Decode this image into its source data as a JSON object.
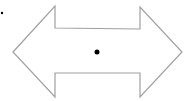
{
  "diagram": {
    "shape": "left-right-double-arrow",
    "stroke_color": "#a0a0a0",
    "fill_color": "#ffffff",
    "dot_color": "#000000",
    "handles": {
      "center": {
        "x": 97,
        "y": 52
      },
      "adjust": {
        "x": 2,
        "y": 13
      }
    }
  }
}
